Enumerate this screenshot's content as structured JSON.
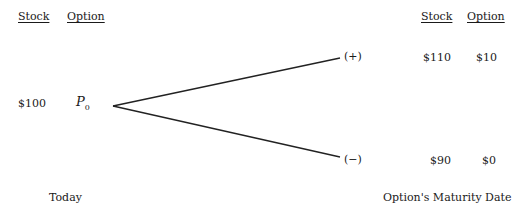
{
  "left_header": {
    "stock": "Stock",
    "option": "Option"
  },
  "right_header": {
    "stock": "Stock",
    "option": "Option"
  },
  "today": {
    "stock_price": "$100",
    "option_symbol": "P",
    "option_subscript": "0"
  },
  "up_state": {
    "label": "(+)",
    "stock_price": "$110",
    "option_value": "$10"
  },
  "down_state": {
    "label": "(−)",
    "stock_price": "$90",
    "option_value": "$0"
  },
  "footer": {
    "left": "Today",
    "right": "Option's Maturity Date"
  }
}
